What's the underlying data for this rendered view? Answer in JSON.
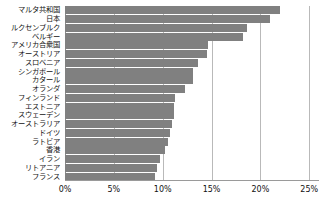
{
  "chart_data": {
    "type": "bar",
    "orientation": "horizontal",
    "title": "",
    "xlabel": "",
    "ylabel": "",
    "xlim": [
      0,
      26
    ],
    "xticks": [
      "0%",
      "5%",
      "10%",
      "15%",
      "20%",
      "25%"
    ],
    "xtick_values": [
      0,
      5,
      10,
      15,
      20,
      25
    ],
    "grid": true,
    "legend": "none",
    "bar_color": "#808080",
    "categories": [
      "マルタ共和国",
      "日本",
      "ルクセンブルク",
      "ベルギー",
      "アメリカ合衆国",
      "オーストリア",
      "スロベニア",
      "シンガポール",
      "カタール",
      "オランダ",
      "フィンランド",
      "エストニア",
      "スウェーデン",
      "オーストラリア",
      "ドイツ",
      "ラトビア",
      "香港",
      "イラン",
      "リトアニア",
      "フランス"
    ],
    "values": [
      22.0,
      21.0,
      18.6,
      18.2,
      14.6,
      14.5,
      13.6,
      13.1,
      13.1,
      12.3,
      11.3,
      11.2,
      11.2,
      11.0,
      10.7,
      10.5,
      10.2,
      9.7,
      9.4,
      9.2
    ],
    "value_unit": "%"
  }
}
